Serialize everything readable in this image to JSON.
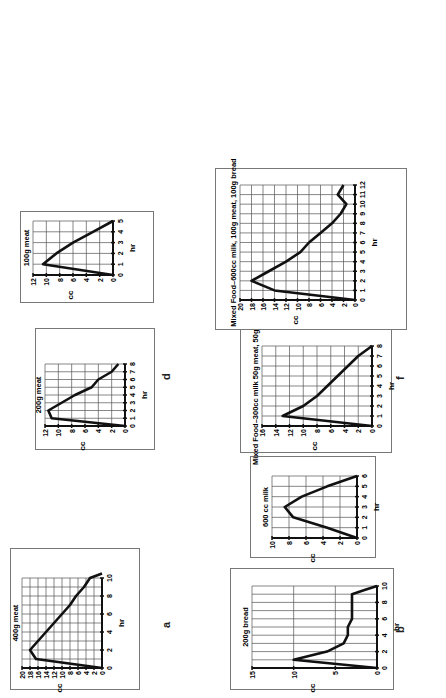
{
  "chart_data": [
    {
      "id": "a",
      "type": "line",
      "title": "400g meat",
      "xlabel": "hr",
      "ylabel": "cc",
      "ylim": [
        0,
        20
      ],
      "yticks": [
        0,
        2,
        4,
        6,
        8,
        10,
        12,
        14,
        16,
        18,
        20
      ],
      "xlim": [
        0,
        10
      ],
      "xticks": [
        0,
        2,
        4,
        6,
        8,
        10
      ],
      "grid": true,
      "x": [
        0,
        1,
        2,
        3,
        4,
        5,
        6,
        7,
        8,
        9,
        10,
        10.5
      ],
      "values": [
        0,
        16.5,
        18,
        16,
        14,
        12,
        10,
        8,
        6.5,
        4.5,
        3,
        0
      ]
    },
    {
      "id": "b",
      "type": "line",
      "title": "200g meat",
      "xlabel": "hr",
      "ylabel": "cc",
      "ylim": [
        0,
        12
      ],
      "yticks": [
        0,
        2,
        4,
        6,
        8,
        10,
        12
      ],
      "xlim": [
        0,
        8
      ],
      "xticks": [
        0,
        1,
        2,
        3,
        4,
        5,
        6,
        7,
        8
      ],
      "grid": true,
      "x": [
        0,
        1,
        2,
        3,
        4,
        5,
        6,
        7,
        8
      ],
      "values": [
        0,
        11,
        11.5,
        9.5,
        7.5,
        5,
        4,
        2,
        1
      ]
    },
    {
      "id": "c",
      "type": "line",
      "title": "100g meat",
      "xlabel": "hr",
      "ylabel": "cc",
      "ylim": [
        0,
        12
      ],
      "yticks": [
        0,
        2,
        4,
        6,
        8,
        10,
        12
      ],
      "xlim": [
        0,
        5
      ],
      "xticks": [
        0,
        1,
        2,
        3,
        4,
        5
      ],
      "grid": true,
      "x": [
        0,
        1,
        2,
        3,
        4,
        5
      ],
      "values": [
        0,
        10.5,
        8.5,
        6,
        3,
        0
      ]
    },
    {
      "id": "d",
      "type": "line",
      "title": "200g bread",
      "xlabel": "hr",
      "ylabel": "cc",
      "ylim": [
        0,
        15
      ],
      "yticks": [
        0,
        5,
        10,
        15
      ],
      "xlim": [
        0,
        10
      ],
      "xticks": [
        0,
        2,
        4,
        6,
        8,
        10
      ],
      "grid": true,
      "x": [
        0,
        1,
        2,
        3,
        4,
        5,
        6,
        7,
        8,
        9,
        9.5,
        10
      ],
      "values": [
        0,
        10,
        6,
        4,
        3.5,
        3.5,
        3,
        3,
        3,
        3,
        1.5,
        0
      ]
    },
    {
      "id": "e",
      "type": "line",
      "title": "600 cc milk",
      "xlabel": "hr",
      "ylabel": "cc",
      "ylim": [
        0,
        10
      ],
      "yticks": [
        0,
        2,
        4,
        6,
        8,
        10
      ],
      "xlim": [
        0,
        6
      ],
      "xticks": [
        0,
        1,
        2,
        3,
        4,
        5,
        6
      ],
      "grid": true,
      "x": [
        0,
        1,
        2,
        3,
        4,
        5,
        6
      ],
      "values": [
        0,
        3.5,
        7.5,
        8.5,
        6.5,
        3.5,
        0
      ]
    },
    {
      "id": "f",
      "type": "line",
      "title": "Mixed Food–300cc milk 50g meat, 50g bread",
      "xlabel": "hr",
      "ylabel": "cc",
      "ylim": [
        0,
        16
      ],
      "yticks": [
        0,
        2,
        4,
        6,
        8,
        10,
        12,
        14,
        16
      ],
      "xlim": [
        0,
        8
      ],
      "xticks": [
        0,
        1,
        2,
        3,
        4,
        5,
        6,
        7,
        8
      ],
      "grid": true,
      "x": [
        0,
        1,
        2,
        3,
        4,
        5,
        6,
        7,
        8
      ],
      "values": [
        0,
        13,
        10,
        8,
        6.5,
        5,
        3.5,
        2,
        0
      ]
    },
    {
      "id": "g",
      "type": "line",
      "title": "Mixed Food–600cc milk, 100g meat, 100g bread",
      "xlabel": "hr",
      "ylabel": "cc",
      "ylim": [
        0,
        20
      ],
      "yticks": [
        0,
        2,
        4,
        6,
        8,
        10,
        12,
        14,
        16,
        18,
        20
      ],
      "xlim": [
        0,
        12
      ],
      "xticks": [
        0,
        1,
        2,
        3,
        4,
        5,
        6,
        7,
        8,
        9,
        10,
        11,
        12
      ],
      "grid": true,
      "x": [
        0,
        1,
        2,
        3,
        4,
        5,
        6,
        7,
        8,
        9,
        10,
        11,
        12
      ],
      "values": [
        0,
        14,
        18,
        15,
        12,
        9.5,
        8,
        6,
        4,
        2.5,
        1.5,
        3,
        2
      ]
    }
  ],
  "panels": [
    {
      "id": "a",
      "label": "a",
      "box": [
        8,
        10,
        140,
        128
      ],
      "plot": [
        30,
        22,
        90,
        80
      ],
      "label_pos": [
        160,
        70
      ]
    },
    {
      "id": "b",
      "label": "b",
      "box": [
        248,
        35,
        120,
        118
      ],
      "plot": [
        272,
        45,
        62,
        80
      ],
      "label_pos": [
        394,
        65
      ]
    },
    {
      "id": "c",
      "label": "c",
      "box": [
        395,
        20,
        90,
        132
      ],
      "plot": [
        423,
        33,
        54,
        80
      ],
      "label_pos": [
        533,
        65
      ]
    },
    {
      "id": "d",
      "label": "d",
      "box": [
        8,
        230,
        120,
        162
      ],
      "plot": [
        30,
        252,
        82,
        125
      ],
      "label_pos": [
        160,
        318
      ]
    },
    {
      "id": "e",
      "label": "e",
      "box": [
        140,
        250,
        100,
        124
      ],
      "plot": [
        160,
        272,
        62,
        85
      ],
      "label_pos": [
        240,
        318
      ]
    },
    {
      "id": "f",
      "label": "f",
      "box": [
        245,
        240,
        122,
        150
      ],
      "plot": [
        272,
        262,
        80,
        110
      ],
      "label_pos": [
        394,
        318
      ]
    },
    {
      "id": "g",
      "label": "g",
      "box": [
        368,
        215,
        160,
        190
      ],
      "plot": [
        398,
        240,
        115,
        115
      ],
      "label_pos": [
        533,
        318
      ]
    }
  ]
}
